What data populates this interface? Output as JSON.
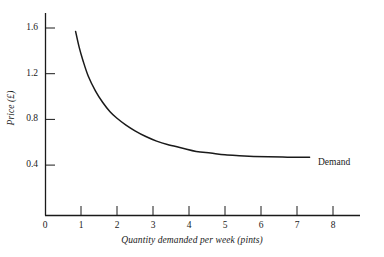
{
  "chart_data": {
    "type": "line",
    "title": "",
    "xlabel": "Quantity demanded per week (pints)",
    "ylabel": "Price (£)",
    "xlim": [
      0,
      8.75
    ],
    "ylim": [
      0,
      1.75
    ],
    "grid": false,
    "legend_position": "inline-right",
    "xticks": [
      0,
      1,
      2,
      3,
      4,
      5,
      6,
      7,
      8
    ],
    "xtick_labels": [
      "0",
      "1",
      "2",
      "3",
      "4",
      "5",
      "6",
      "7",
      "8"
    ],
    "yticks": [
      0.4,
      0.8,
      1.2,
      1.6
    ],
    "ytick_labels": [
      "0.4",
      "0.8",
      "1.2",
      "1.6"
    ],
    "series": [
      {
        "name": "Demand",
        "label_text": "Demand",
        "color": "#1a1a1a",
        "x": [
          0.85,
          0.95,
          1.05,
          1.2,
          1.4,
          1.6,
          1.8,
          2.0,
          2.25,
          2.5,
          2.8,
          3.1,
          3.4,
          3.8,
          4.2,
          4.6,
          5.0,
          5.4,
          5.8,
          6.2,
          6.6,
          7.0,
          7.35
        ],
        "y": [
          1.57,
          1.43,
          1.32,
          1.18,
          1.05,
          0.95,
          0.87,
          0.81,
          0.75,
          0.7,
          0.65,
          0.61,
          0.58,
          0.55,
          0.52,
          0.505,
          0.49,
          0.482,
          0.476,
          0.472,
          0.47,
          0.469,
          0.468
        ]
      }
    ]
  },
  "axes": {
    "x_axis_name": "x-axis",
    "y_axis_name": "y-axis",
    "axis_color": "#1a1a1a"
  },
  "annotations": {
    "demand_label": "Demand"
  }
}
